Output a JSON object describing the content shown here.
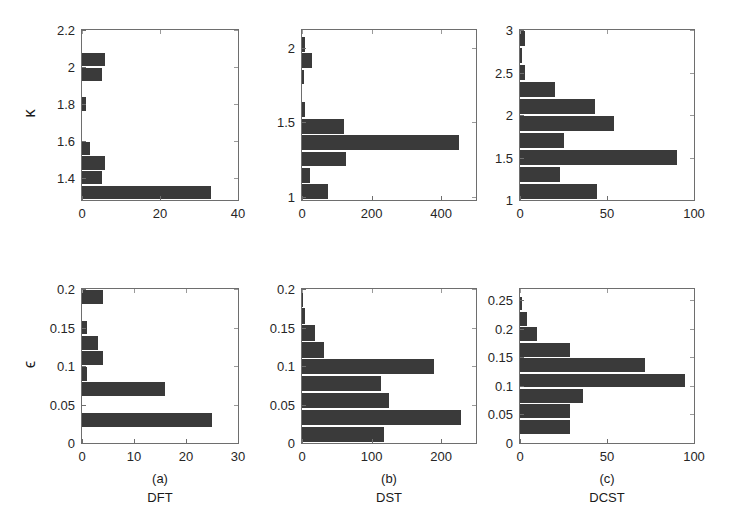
{
  "figure": {
    "background": "#ffffff",
    "bar_color": "#3a3a3a",
    "axis_color": "#6e6e6e",
    "rows": 2,
    "cols": 3
  },
  "captions": [
    {
      "id": "(a)",
      "name": "DFT"
    },
    {
      "id": "(b)",
      "name": "DST"
    },
    {
      "id": "(c)",
      "name": "DCST"
    }
  ],
  "axis_titles": {
    "top_row": "κ",
    "bottom_row": "ϵ"
  },
  "chart_data": [
    {
      "type": "bar",
      "orientation": "horizontal",
      "title": "",
      "panel": "a-top",
      "xlabel": "",
      "ylabel": "κ",
      "xlim": [
        0,
        40
      ],
      "ylim": [
        1.28,
        2.2
      ],
      "xticks": [
        0,
        20,
        40
      ],
      "xticklabels": [
        "0",
        "20",
        "40"
      ],
      "yticks": [
        1.4,
        1.6,
        1.8,
        2.0,
        2.2
      ],
      "yticklabels": [
        "1.4",
        "1.6",
        "1.8",
        "2",
        "2.2"
      ],
      "grid": false,
      "bin_edges": [
        1.28,
        1.36,
        1.44,
        1.52,
        1.6,
        1.68,
        1.76,
        1.84,
        1.92,
        2.0,
        2.08
      ],
      "values": [
        33,
        5,
        6,
        2,
        0,
        0,
        1,
        0,
        5,
        6
      ]
    },
    {
      "type": "bar",
      "orientation": "horizontal",
      "title": "",
      "panel": "b-top",
      "xlabel": "",
      "ylabel": "κ",
      "xlim": [
        0,
        500
      ],
      "ylim": [
        0.98,
        2.12
      ],
      "xticks": [
        0,
        200,
        400
      ],
      "xticklabels": [
        "0",
        "200",
        "400"
      ],
      "yticks": [
        1.0,
        1.5,
        2.0
      ],
      "yticklabels": [
        "1",
        "1.5",
        "2"
      ],
      "grid": false,
      "bin_edges": [
        0.98,
        1.09,
        1.2,
        1.31,
        1.42,
        1.53,
        1.64,
        1.75,
        1.86,
        1.97,
        2.08
      ],
      "values": [
        75,
        22,
        125,
        450,
        122,
        10,
        0,
        5,
        28,
        10
      ]
    },
    {
      "type": "bar",
      "orientation": "horizontal",
      "title": "",
      "panel": "c-top",
      "xlabel": "",
      "ylabel": "κ",
      "xlim": [
        0,
        100
      ],
      "ylim": [
        1.0,
        3.0
      ],
      "xticks": [
        0,
        50,
        100
      ],
      "xticklabels": [
        "0",
        "50",
        "100"
      ],
      "yticks": [
        1.0,
        1.5,
        2.0,
        2.5,
        3.0
      ],
      "yticklabels": [
        "1",
        "1.5",
        "2",
        "2.5",
        "3"
      ],
      "grid": false,
      "bin_edges": [
        1.0,
        1.2,
        1.4,
        1.6,
        1.8,
        2.0,
        2.2,
        2.4,
        2.6,
        2.8,
        3.0
      ],
      "values": [
        44,
        23,
        90,
        25,
        54,
        43,
        20,
        3,
        1,
        3
      ]
    },
    {
      "type": "bar",
      "orientation": "horizontal",
      "title": "",
      "panel": "a-bottom",
      "xlabel": "",
      "ylabel": "ϵ",
      "xlim": [
        0,
        30
      ],
      "ylim": [
        0,
        0.2
      ],
      "xticks": [
        0,
        10,
        20,
        30
      ],
      "xticklabels": [
        "0",
        "10",
        "20",
        "30"
      ],
      "yticks": [
        0,
        0.05,
        0.1,
        0.15,
        0.2
      ],
      "yticklabels": [
        "0",
        "0.05",
        "0.1",
        "0.15",
        "0.2"
      ],
      "grid": false,
      "bin_edges": [
        0.0,
        0.02,
        0.04,
        0.06,
        0.08,
        0.1,
        0.12,
        0.14,
        0.16,
        0.18,
        0.2
      ],
      "values": [
        0,
        25,
        0,
        16,
        1,
        4,
        3,
        1,
        0,
        4,
        4
      ]
    },
    {
      "type": "bar",
      "orientation": "horizontal",
      "title": "",
      "panel": "b-bottom",
      "xlabel": "",
      "ylabel": "ϵ",
      "xlim": [
        0,
        250
      ],
      "ylim": [
        0,
        0.2
      ],
      "xticks": [
        0,
        100,
        200
      ],
      "xticklabels": [
        "0",
        "100",
        "200"
      ],
      "yticks": [
        0,
        0.05,
        0.1,
        0.15,
        0.2
      ],
      "yticklabels": [
        "0",
        "0.05",
        "0.1",
        "0.15",
        "0.2"
      ],
      "grid": false,
      "bin_edges": [
        0.0,
        0.022,
        0.044,
        0.066,
        0.088,
        0.11,
        0.132,
        0.154,
        0.176,
        0.198
      ],
      "values": [
        118,
        228,
        125,
        113,
        190,
        32,
        18,
        5,
        1
      ]
    },
    {
      "type": "bar",
      "orientation": "horizontal",
      "title": "",
      "panel": "c-bottom",
      "xlabel": "",
      "ylabel": "ϵ",
      "xlim": [
        0,
        100
      ],
      "ylim": [
        0,
        0.27
      ],
      "xticks": [
        0,
        50,
        100
      ],
      "xticklabels": [
        "0",
        "50",
        "100"
      ],
      "yticks": [
        0,
        0.05,
        0.1,
        0.15,
        0.2,
        0.25
      ],
      "yticklabels": [
        "0",
        "0.05",
        "0.1",
        "0.15",
        "0.2",
        "0.25"
      ],
      "grid": false,
      "bin_edges": [
        0.015,
        0.042,
        0.069,
        0.096,
        0.123,
        0.15,
        0.177,
        0.204,
        0.231,
        0.258
      ],
      "values": [
        29,
        29,
        36,
        95,
        72,
        29,
        10,
        4,
        1,
        3
      ]
    }
  ]
}
